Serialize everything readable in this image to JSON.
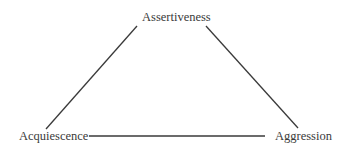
{
  "diagram": {
    "type": "triangle",
    "nodes": [
      {
        "id": "assertiveness",
        "label": "Assertiveness",
        "position": "top"
      },
      {
        "id": "acquiescence",
        "label": "Acquiescence",
        "position": "bottom-left"
      },
      {
        "id": "aggression",
        "label": "Aggression",
        "position": "bottom-right"
      }
    ],
    "edges": [
      {
        "from": "acquiescence",
        "to": "assertiveness"
      },
      {
        "from": "assertiveness",
        "to": "aggression"
      },
      {
        "from": "acquiescence",
        "to": "aggression"
      }
    ],
    "line_color": "#3a3a3a",
    "text_color": "#3a3a3a"
  }
}
